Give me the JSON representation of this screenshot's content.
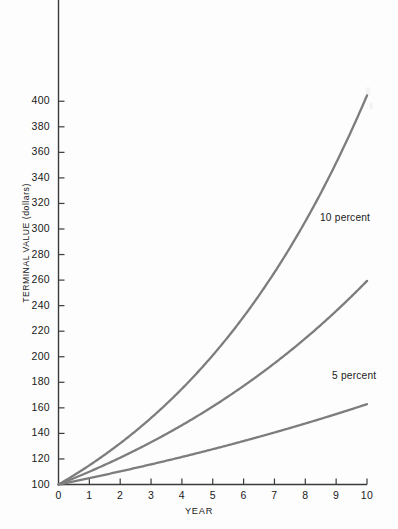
{
  "chart_data": {
    "type": "line",
    "title": "",
    "xlabel": "YEAR",
    "ylabel": "TERMINAL VALUE (dollars)",
    "xlim": [
      0,
      10
    ],
    "ylim": [
      100,
      410
    ],
    "grid": false,
    "legend_position": "inline-annotations",
    "x": [
      0,
      1,
      2,
      3,
      4,
      5,
      6,
      7,
      8,
      9,
      10
    ],
    "xticks": [
      "0",
      "1",
      "2",
      "3",
      "4",
      "5",
      "6",
      "7",
      "8",
      "9",
      "10"
    ],
    "yticks": [
      "100",
      "120",
      "140",
      "160",
      "180",
      "200",
      "220",
      "240",
      "260",
      "280",
      "300",
      "320",
      "340",
      "360",
      "380",
      "400"
    ],
    "ytick_values": [
      100,
      120,
      140,
      160,
      180,
      200,
      220,
      240,
      260,
      280,
      300,
      320,
      340,
      360,
      380,
      400
    ],
    "line_color": "#7d7d7d",
    "axis_color": "#3b3b3b",
    "series": [
      {
        "name": "15 percent",
        "label": "",
        "labeled": false,
        "rate": 0.15,
        "values": [
          100,
          115,
          132.3,
          152.1,
          174.9,
          201.1,
          231.3,
          266.0,
          305.9,
          351.8,
          404.6
        ]
      },
      {
        "name": "10 percent",
        "label": "10 percent",
        "labeled": true,
        "rate": 0.1,
        "values": [
          100,
          110,
          121,
          133.1,
          146.4,
          161.1,
          177.2,
          194.9,
          214.4,
          235.8,
          259.4
        ]
      },
      {
        "name": "5 percent",
        "label": "5 percent",
        "labeled": true,
        "rate": 0.05,
        "values": [
          100,
          105,
          110.3,
          115.8,
          121.6,
          127.6,
          134.0,
          140.7,
          147.7,
          155.1,
          162.9
        ]
      }
    ],
    "annotations": [
      {
        "text": "10 percent",
        "near_x": 9,
        "near_y": 272
      },
      {
        "text": "5 percent",
        "near_x": 9.3,
        "near_y": 175
      }
    ]
  }
}
